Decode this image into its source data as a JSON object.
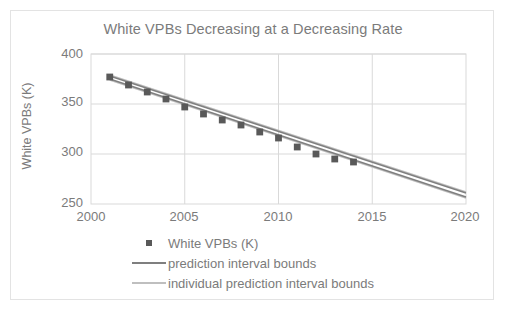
{
  "chart_data": {
    "type": "scatter",
    "title": "White VPBs Decreasing at a Decreasing Rate",
    "xlabel": "",
    "ylabel": "White VPBs (K)",
    "xlim": [
      2000,
      2020
    ],
    "ylim": [
      250,
      400
    ],
    "xticks": [
      "2000",
      "2005",
      "2010",
      "2015",
      "2020"
    ],
    "yticks": [
      "400",
      "350",
      "300",
      "250"
    ],
    "grid": true,
    "legend_position": "bottom",
    "x": [
      2001,
      2002,
      2003,
      2004,
      2005,
      2006,
      2007,
      2008,
      2009,
      2010,
      2011,
      2012,
      2013,
      2014
    ],
    "series": [
      {
        "name": "White VPBs (K)",
        "style": "marker",
        "color": "#595959",
        "values": [
          377,
          369,
          362,
          355,
          347,
          340,
          334,
          329,
          322,
          316,
          307,
          300,
          295,
          292
        ]
      },
      {
        "name": "prediction interval bounds",
        "style": "line",
        "color": "#7f7f7f",
        "x": [
          2001,
          2020
        ],
        "upper": [
          378,
          261
        ],
        "lower": [
          375,
          257
        ]
      },
      {
        "name": "individual prediction interval bounds",
        "style": "line",
        "color": "#bfbfbf",
        "x": [
          2001,
          2020
        ],
        "upper": [
          379,
          262
        ],
        "lower": [
          374,
          256
        ]
      }
    ],
    "legend": [
      {
        "label": "White VPBs (K)",
        "key": "square-marker",
        "color": "#595959"
      },
      {
        "label": "prediction interval bounds",
        "key": "line",
        "color": "#7f7f7f"
      },
      {
        "label": "individual prediction interval bounds",
        "key": "line",
        "color": "#bfbfbf"
      }
    ],
    "colors": {
      "marker": "#595959",
      "prediction_bounds": "#7f7f7f",
      "individual_bounds": "#bfbfbf",
      "grid": "#d9d9d9",
      "text": "#7b7b7b"
    }
  }
}
